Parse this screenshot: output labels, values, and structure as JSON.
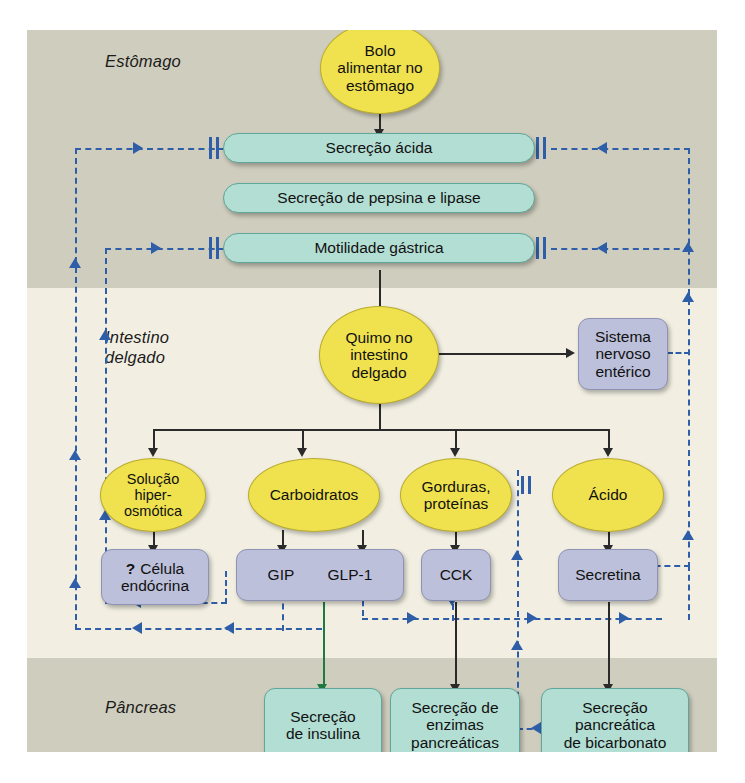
{
  "figure": {
    "language": "pt-BR",
    "bands": [
      {
        "id": "stomach",
        "label": "Estômago",
        "color": "#cfcdbd"
      },
      {
        "id": "intestine",
        "label": "Intestino\ndelgado",
        "color": "#f2efe2"
      },
      {
        "id": "pancreas",
        "label": "Pâncreas",
        "color": "#cfcdbd"
      }
    ],
    "band_labels": {
      "stomach": "Estômago",
      "intestine_line1": "Intestino",
      "intestine_line2": "delgado",
      "pancreas": "Pâncreas"
    },
    "colors": {
      "stimulus_ellipse": "#f0e24f",
      "hormone_box": "#bcc0da",
      "effector_box": "#b3ded4",
      "feedback_line": "#2f5ea8",
      "stimulatory_arrow": "#2a2a2a",
      "insulin_arrow": "#1f7a3f",
      "band_gray": "#cfcdbd",
      "band_cream": "#f2efe2"
    },
    "nodes": {
      "bolo": {
        "label": "Bolo\nalimentar no\nestômago",
        "line1": "Bolo",
        "line2": "alimentar no",
        "line3": "estômago",
        "shape": "ellipse"
      },
      "secrecao_acida": {
        "label": "Secreção ácida",
        "shape": "pill"
      },
      "pepsina_lipase": {
        "label": "Secreção de pepsina e lipase",
        "shape": "pill"
      },
      "motilidade": {
        "label": "Motilidade gástrica",
        "shape": "pill"
      },
      "quimo": {
        "label": "Quimo no\nintestino\ndelgado",
        "line1": "Quimo no",
        "line2": "intestino",
        "line3": "delgado",
        "shape": "ellipse"
      },
      "sne": {
        "label": "Sistema\nnervoso\nentérico",
        "line1": "Sistema",
        "line2": "nervoso",
        "line3": "entérico",
        "shape": "rrect"
      },
      "solucao": {
        "label": "Solução\nhiper-\nosmótica",
        "line1": "Solução",
        "line2": "hiper-",
        "line3": "osmótica",
        "shape": "ellipse"
      },
      "carboidratos": {
        "label": "Carboidratos",
        "shape": "ellipse"
      },
      "gorduras": {
        "label": "Gorduras,\nproteínas",
        "line1": "Gorduras,",
        "line2": "proteínas",
        "shape": "ellipse"
      },
      "acido": {
        "label": "Ácido",
        "shape": "ellipse"
      },
      "celula_endocrina": {
        "prefix": "?",
        "label": "? Célula\nendócrina",
        "line1": "Célula",
        "line2": "endócrina",
        "shape": "rrect"
      },
      "gip": {
        "label": "GIP",
        "shape": "rrect"
      },
      "glp1": {
        "label": "GLP-1",
        "shape": "rrect"
      },
      "cck": {
        "label": "CCK",
        "shape": "rrect"
      },
      "secretina": {
        "label": "Secretina",
        "shape": "rrect"
      },
      "insulina": {
        "label": "Secreção\nde insulina",
        "line1": "Secreção",
        "line2": "de insulina",
        "shape": "teal"
      },
      "enzimas": {
        "label": "Secreção de\nenzimas\npancreáticas",
        "line1": "Secreção de",
        "line2": "enzimas",
        "line3": "pancreáticas",
        "shape": "teal"
      },
      "bicarbonato": {
        "label": "Secreção\npancreática\nde bicarbonato",
        "line1": "Secreção",
        "line2": "pancreática",
        "line3": "de bicarbonato",
        "shape": "teal"
      }
    },
    "legend_semantics": {
      "solid_black_arrow": "estimula / leva a",
      "dashed_blue_arrow": "alça de retroalimentação (feedback)",
      "double_bar": "inibição",
      "green_arrow": "secreção de insulina estimulada por GIP e GLP-1"
    }
  }
}
